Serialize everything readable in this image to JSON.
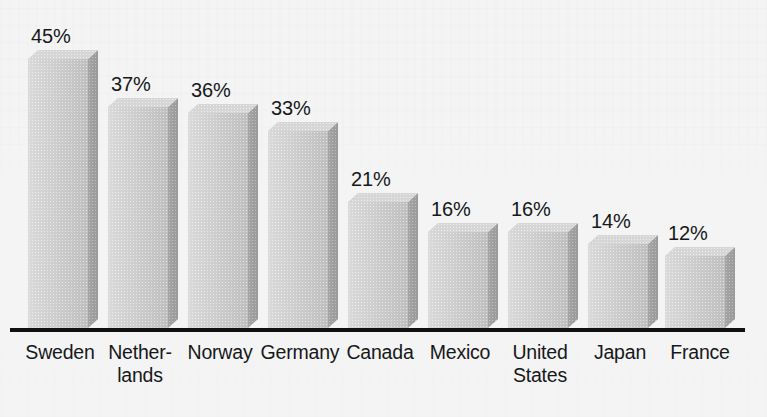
{
  "chart_data": {
    "type": "bar",
    "title": "",
    "subtitle": "",
    "xlabel": "",
    "ylabel": "",
    "categories": [
      "Sweden",
      "Netherlands",
      "Norway",
      "Germany",
      "Canada",
      "Mexico",
      "United States",
      "Japan",
      "France"
    ],
    "values": [
      45,
      37,
      36,
      33,
      21,
      16,
      16,
      14,
      12
    ],
    "value_labels": [
      "45%",
      "37%",
      "36%",
      "33%",
      "21%",
      "16%",
      "16%",
      "14%",
      "12%"
    ],
    "unit": "%",
    "ylim": [
      0,
      50
    ],
    "grid": false,
    "legend": null,
    "style": "3d-bars-grayscale",
    "axis_visible": {
      "x": true,
      "y": false
    }
  },
  "bars": [
    {
      "label_lines": [
        "Sweden"
      ],
      "value_label": "45%",
      "value": 45
    },
    {
      "label_lines": [
        "Nether-",
        "lands"
      ],
      "value_label": "37%",
      "value": 37
    },
    {
      "label_lines": [
        "Norway"
      ],
      "value_label": "36%",
      "value": 36
    },
    {
      "label_lines": [
        "Germany"
      ],
      "value_label": "33%",
      "value": 33
    },
    {
      "label_lines": [
        "Canada"
      ],
      "value_label": "21%",
      "value": 21
    },
    {
      "label_lines": [
        "Mexico"
      ],
      "value_label": "16%",
      "value": 16
    },
    {
      "label_lines": [
        "United",
        "States"
      ],
      "value_label": "16%",
      "value": 16
    },
    {
      "label_lines": [
        "Japan"
      ],
      "value_label": "14%",
      "value": 14
    },
    {
      "label_lines": [
        "France"
      ],
      "value_label": "12%",
      "value": 12
    }
  ],
  "colors": {
    "background": "#f4f4f4",
    "bar_front": "#c9c9c9",
    "bar_side": "#ababab",
    "bar_top": "#d6d6d6",
    "axis": "#101012",
    "text": "#16181a"
  }
}
